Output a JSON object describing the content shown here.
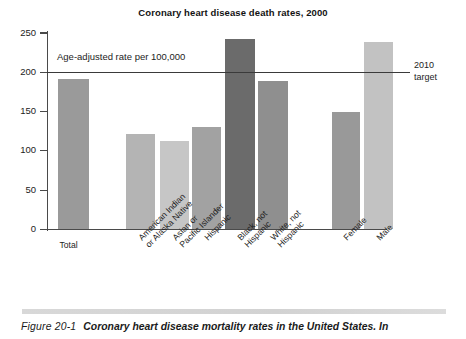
{
  "figure": {
    "number_label": "Figure 20-1",
    "caption_text": "Coronary heart disease mortality rates in the United States. In"
  },
  "chart_data": {
    "type": "bar",
    "title": "Coronary heart disease death rates, 2000",
    "xlabel": "",
    "ylabel": "",
    "ylim": [
      0,
      250
    ],
    "yticks": [
      0,
      50,
      100,
      150,
      200,
      250
    ],
    "ytick_labels": [
      "0",
      "50",
      "100",
      "150",
      "200",
      "250"
    ],
    "grid": false,
    "legend": "none",
    "annotations": [
      {
        "name": "axis-units-note",
        "text": "Age-adjusted rate per 100,000"
      },
      {
        "name": "target-line-label",
        "text": "2010\ntarget",
        "line1": "2010",
        "line2": "target",
        "value": 200
      }
    ],
    "reference_line": {
      "label": "2010 target",
      "value": 200
    },
    "categories": [
      "Total",
      "American Indian\nor Alaska Native",
      "Asian or\nPacific Islander",
      "Hispanic",
      "Black, not\nHispanic",
      "White, not\nHispanic",
      "Female",
      "Male"
    ],
    "values": [
      192,
      121,
      112,
      131,
      243,
      189,
      149,
      238
    ],
    "bar_colors": [
      "#9a9a9a",
      "#b4b4b4",
      "#c6c6c6",
      "#a2a2a2",
      "#6b6b6b",
      "#8f8f8f",
      "#999999",
      "#c2c2c2"
    ],
    "bars": [
      {
        "label": "Total",
        "label_line1": "Total",
        "label_line2": "",
        "value": 192,
        "color": "#9a9a9a",
        "rotated": false
      },
      {
        "label": "American Indian or Alaska Native",
        "label_line1": "American Indian",
        "label_line2": "or Alaska Native",
        "value": 121,
        "color": "#b4b4b4",
        "rotated": true
      },
      {
        "label": "Asian or Pacific Islander",
        "label_line1": "Asian or",
        "label_line2": "Pacific Islander",
        "value": 112,
        "color": "#c6c6c6",
        "rotated": true
      },
      {
        "label": "Hispanic",
        "label_line1": "Hispanic",
        "label_line2": "",
        "value": 131,
        "color": "#a2a2a2",
        "rotated": true
      },
      {
        "label": "Black, not Hispanic",
        "label_line1": "Black, not",
        "label_line2": "Hispanic",
        "value": 243,
        "color": "#6b6b6b",
        "rotated": true
      },
      {
        "label": "White, not Hispanic",
        "label_line1": "White, not",
        "label_line2": "Hispanic",
        "value": 189,
        "color": "#8f8f8f",
        "rotated": true
      },
      {
        "label": "Female",
        "label_line1": "Female",
        "label_line2": "",
        "value": 149,
        "color": "#999999",
        "rotated": true
      },
      {
        "label": "Male",
        "label_line1": "Male",
        "label_line2": "",
        "value": 238,
        "color": "#c2c2c2",
        "rotated": true
      }
    ]
  },
  "colors": {
    "axis": "#4a4a4a",
    "text": "#1d1d1d",
    "reference_line": "#3a3a3a",
    "rule_bar": "#d6d6d6"
  }
}
